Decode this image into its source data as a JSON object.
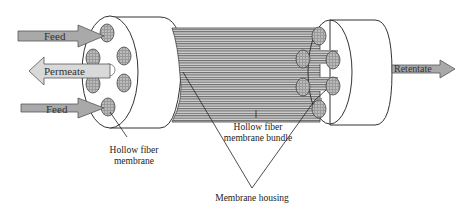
{
  "diagram": {
    "type": "hollow-fiber-membrane-module",
    "arrows": {
      "feed_top": "Feed",
      "permeate": "Permeate",
      "feed_bottom": "Feed",
      "retentate": "Retentate"
    },
    "labels": {
      "hollow_fiber_membrane_line1": "Hollow fiber",
      "hollow_fiber_membrane_line2": "membrane",
      "bundle_line1": "Hollow fiber",
      "bundle_line2": "membrane bundle",
      "housing": "Membrane housing"
    },
    "colors": {
      "arrow_fill": "#a9a9a9",
      "arrow_stroke": "#555555",
      "fiber_dark": "#6e6e6e",
      "fiber_light": "#c8c8c8",
      "outline": "#333333",
      "background": "#ffffff"
    }
  }
}
